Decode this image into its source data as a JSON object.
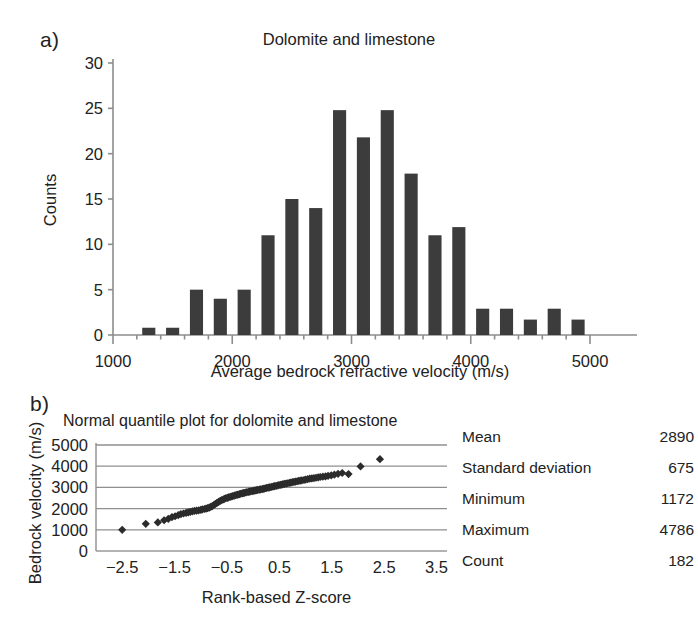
{
  "figure": {
    "panel_a_letter": "a)",
    "panel_b_letter": "b)"
  },
  "stats": {
    "rows": [
      {
        "label": "Mean",
        "value": "2890"
      },
      {
        "label": "Standard deviation",
        "value": "675"
      },
      {
        "label": "Minimum",
        "value": "1172"
      },
      {
        "label": "Maximum",
        "value": "4786"
      },
      {
        "label": "Count",
        "value": "182"
      }
    ]
  },
  "chart_data": [
    {
      "type": "bar",
      "id": "histogram",
      "title": "Dolomite and limestone",
      "xlabel": "Average bedrock refractive velocity (m/s)",
      "ylabel": "Counts",
      "xlim": [
        1000,
        5100
      ],
      "ylim": [
        0,
        30
      ],
      "xticks": [
        1000,
        2000,
        3000,
        4000,
        5000
      ],
      "xtick_labels": [
        "1000",
        "2000",
        "3000",
        "4000",
        "5000"
      ],
      "xminor_tick_step": 200,
      "yticks": [
        0,
        5,
        10,
        15,
        20,
        25,
        30
      ],
      "ytick_labels": [
        "0",
        "5",
        "10",
        "15",
        "20",
        "25",
        "30"
      ],
      "grid": false,
      "bar_color": "#3c3c3c",
      "bar_width_units": 110,
      "categories": [
        1300,
        1500,
        1700,
        1900,
        2100,
        2300,
        2500,
        2700,
        2900,
        3100,
        3300,
        3500,
        3700,
        3900,
        4100,
        4300,
        4500,
        4700,
        4900
      ],
      "values": [
        0.8,
        0.8,
        5,
        4,
        5,
        11,
        15,
        14,
        24.8,
        21.8,
        24.8,
        17.8,
        11,
        11.9,
        2.9,
        2.9,
        1.7,
        2.9,
        1.7
      ]
    },
    {
      "type": "scatter",
      "id": "normal-quantile-plot",
      "title": "Normal quantile plot for dolomite and limestone",
      "xlabel": "Rank-based Z-score",
      "ylabel": "Bedrock velocity (m/s)",
      "xlim": [
        -3.0,
        3.7
      ],
      "ylim": [
        0,
        5400
      ],
      "xticks": [
        -2.5,
        -1.5,
        -0.5,
        0.5,
        1.5,
        2.5,
        3.5
      ],
      "xtick_labels": [
        "−2.5",
        "−1.5",
        "−0.5",
        "0.5",
        "1.5",
        "2.5",
        "3.5"
      ],
      "yticks": [
        0,
        1000,
        2000,
        3000,
        4000,
        5000
      ],
      "ytick_labels": [
        "0",
        "1000",
        "2000",
        "3000",
        "4000",
        "5000"
      ],
      "grid": true,
      "grid_axis": "y",
      "marker": "diamond",
      "marker_color": "#2b2b2b",
      "points": [
        [
          -2.5,
          1000
        ],
        [
          -2.05,
          1280
        ],
        [
          -1.82,
          1350
        ],
        [
          -1.7,
          1450
        ],
        [
          -1.62,
          1520
        ],
        [
          -1.55,
          1600
        ],
        [
          -1.49,
          1640
        ],
        [
          -1.43,
          1690
        ],
        [
          -1.38,
          1740
        ],
        [
          -1.33,
          1770
        ],
        [
          -1.28,
          1800
        ],
        [
          -1.24,
          1820
        ],
        [
          -1.2,
          1850
        ],
        [
          -1.16,
          1870
        ],
        [
          -1.12,
          1890
        ],
        [
          -1.08,
          1900
        ],
        [
          -1.04,
          1920
        ],
        [
          -1.0,
          1940
        ],
        [
          -0.97,
          1960
        ],
        [
          -0.93,
          1980
        ],
        [
          -0.9,
          2000
        ],
        [
          -0.87,
          2020
        ],
        [
          -0.84,
          2050
        ],
        [
          -0.81,
          2080
        ],
        [
          -0.78,
          2120
        ],
        [
          -0.75,
          2170
        ],
        [
          -0.72,
          2220
        ],
        [
          -0.69,
          2270
        ],
        [
          -0.66,
          2320
        ],
        [
          -0.63,
          2360
        ],
        [
          -0.6,
          2400
        ],
        [
          -0.57,
          2430
        ],
        [
          -0.55,
          2460
        ],
        [
          -0.52,
          2490
        ],
        [
          -0.49,
          2510
        ],
        [
          -0.47,
          2530
        ],
        [
          -0.44,
          2550
        ],
        [
          -0.41,
          2570
        ],
        [
          -0.39,
          2590
        ],
        [
          -0.36,
          2610
        ],
        [
          -0.34,
          2630
        ],
        [
          -0.31,
          2650
        ],
        [
          -0.29,
          2660
        ],
        [
          -0.26,
          2680
        ],
        [
          -0.24,
          2700
        ],
        [
          -0.21,
          2715
        ],
        [
          -0.19,
          2730
        ],
        [
          -0.17,
          2745
        ],
        [
          -0.14,
          2760
        ],
        [
          -0.12,
          2775
        ],
        [
          -0.09,
          2790
        ],
        [
          -0.07,
          2800
        ],
        [
          -0.05,
          2815
        ],
        [
          -0.02,
          2825
        ],
        [
          0.0,
          2840
        ],
        [
          0.02,
          2850
        ],
        [
          0.05,
          2860
        ],
        [
          0.07,
          2875
        ],
        [
          0.09,
          2885
        ],
        [
          0.12,
          2895
        ],
        [
          0.14,
          2905
        ],
        [
          0.17,
          2920
        ],
        [
          0.19,
          2930
        ],
        [
          0.21,
          2945
        ],
        [
          0.24,
          2960
        ],
        [
          0.26,
          2975
        ],
        [
          0.29,
          2990
        ],
        [
          0.31,
          3000
        ],
        [
          0.34,
          3015
        ],
        [
          0.36,
          3030
        ],
        [
          0.39,
          3045
        ],
        [
          0.41,
          3060
        ],
        [
          0.44,
          3075
        ],
        [
          0.47,
          3090
        ],
        [
          0.49,
          3105
        ],
        [
          0.52,
          3120
        ],
        [
          0.55,
          3135
        ],
        [
          0.57,
          3150
        ],
        [
          0.6,
          3165
        ],
        [
          0.63,
          3180
        ],
        [
          0.66,
          3195
        ],
        [
          0.69,
          3210
        ],
        [
          0.72,
          3225
        ],
        [
          0.75,
          3245
        ],
        [
          0.78,
          3260
        ],
        [
          0.81,
          3275
        ],
        [
          0.84,
          3290
        ],
        [
          0.87,
          3305
        ],
        [
          0.9,
          3320
        ],
        [
          0.93,
          3335
        ],
        [
          0.97,
          3350
        ],
        [
          1.0,
          3370
        ],
        [
          1.04,
          3390
        ],
        [
          1.08,
          3410
        ],
        [
          1.12,
          3425
        ],
        [
          1.16,
          3440
        ],
        [
          1.2,
          3455
        ],
        [
          1.24,
          3470
        ],
        [
          1.28,
          3490
        ],
        [
          1.33,
          3505
        ],
        [
          1.38,
          3520
        ],
        [
          1.43,
          3545
        ],
        [
          1.49,
          3570
        ],
        [
          1.55,
          3600
        ],
        [
          1.62,
          3640
        ],
        [
          1.7,
          3680
        ],
        [
          1.82,
          3630
        ],
        [
          2.05,
          3990
        ],
        [
          2.42,
          4330
        ]
      ]
    }
  ]
}
